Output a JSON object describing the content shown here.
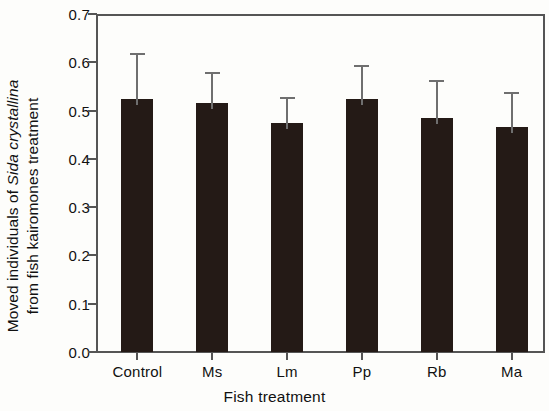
{
  "chart_data": {
    "type": "bar",
    "title": "",
    "xlabel": "Fish treatment",
    "ylabel_line1": "Moved individuals of ",
    "ylabel_line1_italic": "Sida crystallina",
    "ylabel_line2": "from fish kairomones treatment",
    "categories": [
      "Control",
      "Ms",
      "Lm",
      "Pp",
      "Rb",
      "Ma"
    ],
    "values": [
      0.525,
      0.515,
      0.475,
      0.525,
      0.485,
      0.465
    ],
    "errors_upper": [
      0.09,
      0.06,
      0.05,
      0.065,
      0.075,
      0.07
    ],
    "error_bar_style": "upper-only",
    "ylim": [
      0.0,
      0.7
    ],
    "ytick_labels": [
      "0.0",
      "0.1",
      "0.2",
      "0.3",
      "0.4",
      "0.5",
      "0.6",
      "0.7"
    ],
    "ytick_values": [
      0.0,
      0.1,
      0.2,
      0.3,
      0.4,
      0.5,
      0.6,
      0.7
    ],
    "grid": false,
    "legend": null,
    "bar_color": "#241a16",
    "error_color": "#6f6f6f",
    "axis_color": "#555555",
    "background_color": "#fdfdfb"
  }
}
